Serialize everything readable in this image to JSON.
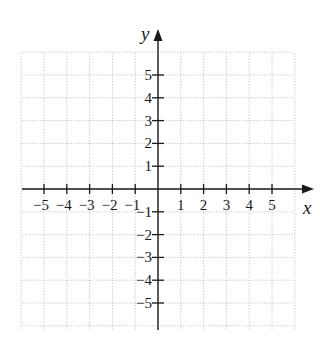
{
  "chart_data": {
    "type": "scatter",
    "title": "",
    "xlabel": "x",
    "ylabel": "y",
    "xlim": [
      -6,
      6
    ],
    "ylim": [
      -6,
      6
    ],
    "grid": true,
    "x_ticks": [
      -5,
      -4,
      -3,
      -2,
      -1,
      1,
      2,
      3,
      4,
      5
    ],
    "y_ticks": [
      -5,
      -4,
      -3,
      -2,
      -1,
      1,
      2,
      3,
      4,
      5
    ],
    "x_tick_labels": [
      "−5",
      "−4",
      "−3",
      "−2",
      "−1",
      "1",
      "2",
      "3",
      "4",
      "5"
    ],
    "y_tick_labels": [
      "−5",
      "−4",
      "−3",
      "−2",
      "−1",
      "1",
      "2",
      "3",
      "4",
      "5"
    ],
    "series": []
  },
  "labels": {
    "x_axis": "x",
    "y_axis": "y"
  },
  "colors": {
    "axis": "#1a1a1a",
    "grid": "#b5b5b5",
    "background": "#ffffff"
  }
}
